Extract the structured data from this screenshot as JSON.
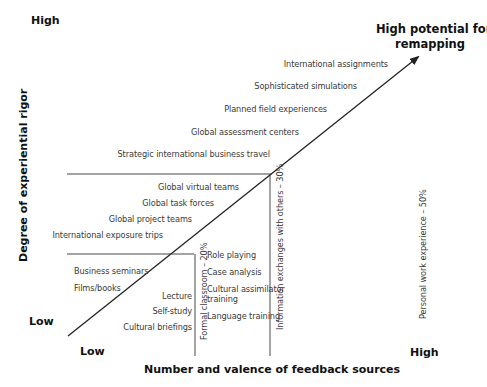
{
  "y_axis": {
    "title": "Degree of experiential rigor",
    "high_label": "High",
    "low_label": "Low"
  },
  "x_axis": {
    "title": "Number and valence of feedback sources",
    "low_label": "Low",
    "high_label": "High"
  },
  "arrow_label": {
    "line1": "High potential for",
    "line2": "remapping"
  },
  "upper_items": [
    "International assignments",
    "Sophisticated simulations",
    "Planned field experiences",
    "Global assessment centers",
    "Strategic international business travel"
  ],
  "middle_items": [
    "Global virtual teams",
    "Global task forces",
    "Global project teams",
    "International exposure trips"
  ],
  "lower_left_items": [
    "Business seminars",
    "Films/books"
  ],
  "lower_right_of_arrow_items": [
    "Lecture",
    "Self-study",
    "Cultural briefings"
  ],
  "formal_classroom_items": [
    "Role playing",
    "Case analysis",
    "Cultural assimilator",
    "training",
    "Language training"
  ],
  "vertical_labels": {
    "formal_classroom": "Formal classroom – 20%",
    "information_exchanges": "Information exchanges with others – 30%",
    "personal_work": "Personal work experience – 50%"
  },
  "colors": {
    "line": "#222222",
    "text": "#3a3a3a",
    "bold_text": "#111111"
  }
}
